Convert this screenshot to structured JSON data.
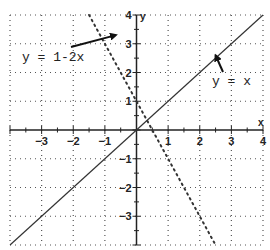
{
  "chart_data": {
    "type": "line",
    "title": "",
    "xlabel": "x",
    "ylabel": "y",
    "xlim": [
      -4,
      4
    ],
    "ylim": [
      -4,
      4
    ],
    "grid": true,
    "grid_style": "dotted",
    "x_ticks": [
      -3,
      -2,
      -1,
      1,
      2,
      3,
      4
    ],
    "y_ticks": [
      4,
      3,
      2,
      1,
      -1,
      -2,
      -3
    ],
    "x_tick_labels": [
      "-3",
      "-2",
      "-1",
      "1",
      "2",
      "3",
      "4"
    ],
    "y_tick_labels": [
      "4",
      "3",
      "2",
      "1",
      "-1",
      "-2",
      "-3"
    ],
    "series": [
      {
        "name": "y = x",
        "style": "solid",
        "color": "#333333",
        "x": [
          -4,
          4
        ],
        "y": [
          -4,
          4
        ]
      },
      {
        "name": "y = 1-2x",
        "style": "dotted",
        "color": "#333333",
        "x": [
          -1.5,
          2.5
        ],
        "y": [
          4,
          -4
        ]
      }
    ],
    "annotations": [
      {
        "text": "y = 1-2x",
        "arrow_to": [
          -0.65,
          3.3
        ],
        "text_pos": [
          -3.6,
          2.6
        ]
      },
      {
        "text": "y = x",
        "arrow_to": [
          2.5,
          2.6
        ],
        "text_pos": [
          2.4,
          1.6
        ]
      }
    ]
  },
  "labels": {
    "x_axis_name": "x",
    "y_axis_name": "y",
    "annotation_line2": "y = 1-2x",
    "annotation_line1": "y = x"
  }
}
